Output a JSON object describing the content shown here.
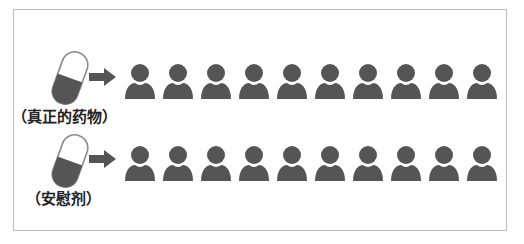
{
  "colors": {
    "icon_fill": "#555555",
    "pill_outline": "#8a8a8a",
    "border": "#bdbdbd",
    "label_text": "#222222"
  },
  "rows": [
    {
      "label": "（真正的药物）",
      "pill_icon": "capsule-icon",
      "arrow_icon": "arrow-right-icon",
      "person_icon": "person-icon",
      "person_count": 10
    },
    {
      "label": "（安慰剂）",
      "pill_icon": "capsule-icon",
      "arrow_icon": "arrow-right-icon",
      "person_icon": "person-icon",
      "person_count": 10
    }
  ]
}
